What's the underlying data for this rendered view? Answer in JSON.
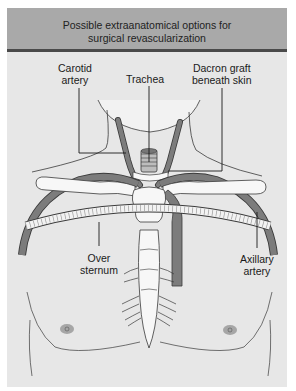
{
  "figure": {
    "title_lines": [
      "Possible extraanatomical options for",
      "surgical revascularization"
    ],
    "colors": {
      "background": "#e7e7e7",
      "title_bar": "#a9a9a9",
      "title_rule": "#4a4a4a",
      "artery": "#7c7c7c",
      "bone": "#f7f7f7",
      "outline": "#3a3a3a",
      "nipple": "#a6a6a6"
    }
  },
  "labels": {
    "carotid": [
      "Carotid",
      "artery"
    ],
    "trachea": [
      "Trachea"
    ],
    "dacron": [
      "Dacron graft",
      "beneath skin"
    ],
    "sternum": [
      "Over",
      "sternum"
    ],
    "axillary": [
      "Axillary",
      "artery"
    ]
  }
}
